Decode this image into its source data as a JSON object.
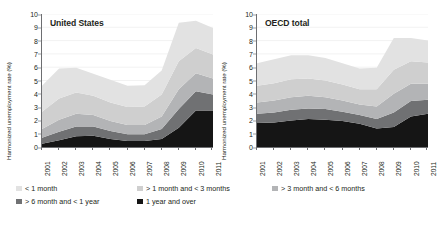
{
  "yaxis_label": "Harmonized unemployment rate (%)",
  "yticks": [
    "0",
    "1",
    "2",
    "3",
    "4",
    "5",
    "6",
    "7",
    "8",
    "9",
    "10"
  ],
  "colors": {
    "s_lt1m": "#e2e2e2",
    "s_1to3m": "#cfcfcf",
    "s_3to6m": "#b3b4b6",
    "s_6to12m": "#707173",
    "s_1y": "#151515",
    "axis": "#6d6e71",
    "grid": "#ededed",
    "text": "#231f20"
  },
  "legend": {
    "items": [
      {
        "label": "< 1 month",
        "color": "#e2e2e2",
        "row": 0,
        "col": 0
      },
      {
        "label": "> 1 month and < 3 months",
        "color": "#cfcfcf",
        "row": 0,
        "col": 1
      },
      {
        "label": "> 3 month and < 6 months",
        "color": "#b3b4b6",
        "row": 0,
        "col": 2
      },
      {
        "label": "> 6 month and < 1 year",
        "color": "#707173",
        "row": 1,
        "col": 0
      },
      {
        "label": "1 year and over",
        "color": "#151515",
        "row": 1,
        "col": 1
      }
    ]
  },
  "chart_data": [
    {
      "type": "area",
      "title": "United States",
      "xlabel": "",
      "ylabel": "Harmonized unemployment rate (%)",
      "ylim": [
        0,
        10
      ],
      "grid": true,
      "legend_position": "bottom",
      "categories": [
        "2001",
        "2002",
        "2003",
        "2004",
        "2005",
        "2006",
        "2007",
        "2008",
        "2009",
        "2010",
        "2011"
      ],
      "series": [
        {
          "name": "1 year and over",
          "color": "#151515",
          "values": [
            0.25,
            0.5,
            0.8,
            0.85,
            0.6,
            0.45,
            0.45,
            0.6,
            1.45,
            2.75,
            2.75
          ]
        },
        {
          "name": "> 6 month and < 1 year",
          "color": "#707173",
          "values": [
            0.45,
            0.65,
            0.75,
            0.7,
            0.6,
            0.5,
            0.5,
            0.75,
            1.4,
            1.45,
            1.2
          ]
        },
        {
          "name": "> 3 month and < 6 months",
          "color": "#b3b4b6",
          "values": [
            0.65,
            0.9,
            0.95,
            0.85,
            0.75,
            0.7,
            0.7,
            0.95,
            1.5,
            1.35,
            1.2
          ]
        },
        {
          "name": "> 1 month and < 3 months",
          "color": "#cfcfcf",
          "values": [
            1.3,
            1.6,
            1.6,
            1.45,
            1.4,
            1.35,
            1.4,
            1.65,
            2.1,
            1.9,
            1.8
          ]
        },
        {
          "name": "< 1 month",
          "color": "#e2e2e2",
          "values": [
            1.95,
            2.25,
            1.85,
            1.65,
            1.7,
            1.6,
            1.6,
            1.8,
            2.9,
            2.05,
            2.0
          ]
        }
      ],
      "totals": [
        4.6,
        5.9,
        5.95,
        5.5,
        5.05,
        4.6,
        4.65,
        5.75,
        9.35,
        9.5,
        8.95
      ]
    },
    {
      "type": "area",
      "title": "OECD total",
      "xlabel": "",
      "ylabel": "Harmonized unemployment rate (%)",
      "ylim": [
        0,
        10
      ],
      "grid": true,
      "legend_position": "bottom",
      "categories": [
        "2001",
        "2002",
        "2003",
        "2004",
        "2005",
        "2006",
        "2007",
        "2008",
        "2009",
        "2010",
        "2011"
      ],
      "series": [
        {
          "name": "1 year and over",
          "color": "#151515",
          "values": [
            1.8,
            1.85,
            2.0,
            2.1,
            2.05,
            1.95,
            1.75,
            1.4,
            1.5,
            2.3,
            2.5
          ]
        },
        {
          "name": "> 6 month and < 1 year",
          "color": "#707173",
          "values": [
            0.7,
            0.75,
            0.8,
            0.8,
            0.8,
            0.7,
            0.65,
            0.7,
            1.1,
            1.15,
            1.05
          ]
        },
        {
          "name": "> 3 month and < 6 months",
          "color": "#b3b4b6",
          "values": [
            0.85,
            0.9,
            0.95,
            0.95,
            0.9,
            0.85,
            0.8,
            0.95,
            1.4,
            1.3,
            1.2
          ]
        },
        {
          "name": "> 1 month and < 3 months",
          "color": "#cfcfcf",
          "values": [
            1.25,
            1.3,
            1.35,
            1.3,
            1.25,
            1.2,
            1.15,
            1.3,
            1.8,
            1.7,
            1.6
          ]
        },
        {
          "name": "< 1 month",
          "color": "#e2e2e2",
          "values": [
            1.7,
            1.8,
            1.8,
            1.75,
            1.7,
            1.6,
            1.55,
            1.6,
            2.4,
            1.75,
            1.65
          ]
        }
      ],
      "totals": [
        6.3,
        6.6,
        6.9,
        6.9,
        6.7,
        6.3,
        5.9,
        5.95,
        8.2,
        8.2,
        8.0
      ]
    }
  ]
}
